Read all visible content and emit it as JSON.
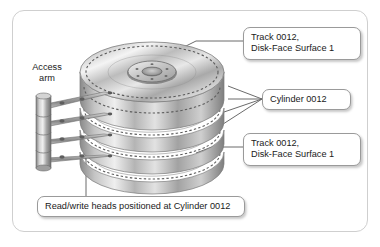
{
  "figure": {
    "background_color": "#ffffff",
    "frame_border_color": "#cfcfcf"
  },
  "labels": {
    "access_arm": {
      "line1": "Access",
      "line2": "arm"
    },
    "track_top": {
      "line1": "Track 0012,",
      "line2": "Disk-Face Surface 1"
    },
    "cylinder": {
      "line1": "Cylinder 0012"
    },
    "track_bottom": {
      "line1": "Track 0012,",
      "line2": "Disk-Face Surface 1"
    },
    "heads": {
      "line1": "Read/write heads positioned at Cylinder 0012"
    }
  },
  "diagram": {
    "platter_count": 4,
    "arm_count": 4,
    "hub_screw_holes": 6,
    "cylinder_leader_lines": 4,
    "colors": {
      "platter_light": "#f2f2f2",
      "platter_mid": "#b9b9b9",
      "platter_dark": "#6f6f6f",
      "edge_stroke": "#8a8a8a",
      "leader_line": "#6b6b6b",
      "arm_metal": "#9c9c9c",
      "hub_dark": "#4a4a4a"
    }
  }
}
